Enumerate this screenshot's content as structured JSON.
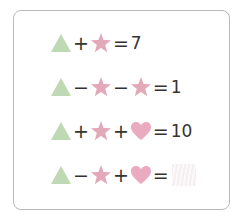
{
  "colors": {
    "triangle": "#b8d8b0",
    "star": "#e0a8b8",
    "heart": "#e8aac0",
    "border": "#b9b9b9"
  },
  "equations": [
    {
      "terms": [
        "triangle",
        "+",
        "star"
      ],
      "result": "7"
    },
    {
      "terms": [
        "triangle",
        "−",
        "star",
        "−",
        "star"
      ],
      "result": "1"
    },
    {
      "terms": [
        "triangle",
        "+",
        "star",
        "+",
        "heart"
      ],
      "result": "10"
    },
    {
      "terms": [
        "triangle",
        "−",
        "star",
        "+",
        "heart"
      ],
      "result": ""
    }
  ],
  "symbols": {
    "plus": "+",
    "minus": "−",
    "equals": "="
  },
  "row1": {
    "op1": "+",
    "eq": "=",
    "result": "7"
  },
  "row2": {
    "op1": "−",
    "op2": "−",
    "eq": "=",
    "result": "1"
  },
  "row3": {
    "op1": "+",
    "op2": "+",
    "eq": "=",
    "result": "10"
  },
  "row4": {
    "op1": "−",
    "op2": "+",
    "eq": "="
  }
}
